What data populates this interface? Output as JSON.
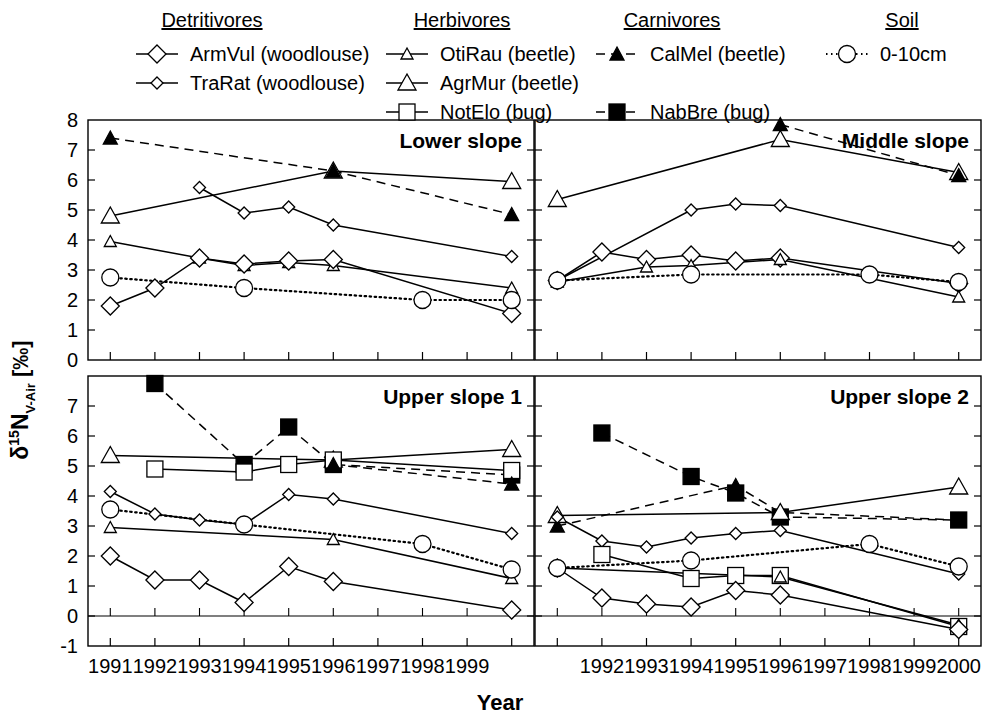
{
  "figure": {
    "xlabel": "Year",
    "ylabel_parts": {
      "delta": "δ",
      "mass": "15",
      "element": "N",
      "sub": "V-Air",
      "units": "[‰]"
    },
    "ylabel_plain": "δ15N V-Air [‰]"
  },
  "legend": {
    "groups": [
      {
        "title": "Detritivores",
        "entries": [
          {
            "label": "ArmVul (woodlouse)",
            "marker": "diamond-large",
            "line": "solid",
            "fill": "open"
          },
          {
            "label": "TraRat (woodlouse)",
            "marker": "diamond-small",
            "line": "solid",
            "fill": "open"
          }
        ]
      },
      {
        "title": "Herbivores",
        "entries": [
          {
            "label": "OtiRau (beetle)",
            "marker": "triangle-small",
            "line": "solid",
            "fill": "open"
          },
          {
            "label": "AgrMur (beetle)",
            "marker": "triangle-large",
            "line": "solid",
            "fill": "open"
          },
          {
            "label": "NotElo (bug)",
            "marker": "square-open",
            "line": "solid",
            "fill": "open"
          }
        ]
      },
      {
        "title": "Carnivores",
        "entries": [
          {
            "label": "CalMel (beetle)",
            "marker": "triangle-filled",
            "line": "dashed",
            "fill": "filled"
          },
          {
            "label": "NabBre (bug)",
            "marker": "square-filled",
            "line": "dashed",
            "fill": "filled"
          }
        ]
      },
      {
        "title": "Soil",
        "entries": [
          {
            "label": "0-10cm",
            "marker": "circle-open",
            "line": "dotted",
            "fill": "open"
          }
        ]
      }
    ]
  },
  "chart_data": {
    "type": "line",
    "title": "",
    "xlabel": "Year",
    "ylabel": "δ15N V-Air [‰]",
    "grid": false,
    "legend_position": "top",
    "panel_layout": {
      "rows": 2,
      "cols": 2
    },
    "series_styles": {
      "ArmVul": {
        "marker": "diamond-large",
        "line": "solid",
        "fill": "open"
      },
      "TraRat": {
        "marker": "diamond-small",
        "line": "solid",
        "fill": "open"
      },
      "OtiRau": {
        "marker": "triangle-small",
        "line": "solid",
        "fill": "open"
      },
      "AgrMur": {
        "marker": "triangle-large",
        "line": "solid",
        "fill": "open"
      },
      "NotElo": {
        "marker": "square-open",
        "line": "solid",
        "fill": "open"
      },
      "CalMel": {
        "marker": "triangle-filled",
        "line": "dashed",
        "fill": "filled"
      },
      "NabBre": {
        "marker": "square-filled",
        "line": "dashed",
        "fill": "filled"
      },
      "Soil": {
        "marker": "circle-open",
        "line": "dotted",
        "fill": "open"
      }
    },
    "panels": [
      {
        "name": "Lower slope",
        "position": "top-left",
        "xlim": [
          1990.5,
          2000.5
        ],
        "ylim": [
          0,
          8
        ],
        "yticks": [
          0,
          1,
          2,
          3,
          4,
          5,
          6,
          7,
          8
        ],
        "xticks": [
          1991,
          1992,
          1993,
          1994,
          1995,
          1996,
          1997,
          1998,
          1999,
          2000
        ],
        "xticklabels": [
          "1991",
          "1992",
          "1993",
          "1994",
          "1995",
          "1996",
          "1997",
          "1998",
          "1999",
          ""
        ],
        "series": [
          {
            "name": "AgrMur",
            "x": [
              1991,
              1996,
              2000
            ],
            "y": [
              4.8,
              6.3,
              5.95
            ]
          },
          {
            "name": "CalMel",
            "x": [
              1991,
              1996,
              2000
            ],
            "y": [
              7.4,
              6.3,
              4.85
            ]
          },
          {
            "name": "TraRat",
            "x": [
              1993,
              1994,
              1995,
              1996,
              2000
            ],
            "y": [
              5.75,
              4.9,
              5.1,
              4.5,
              3.45
            ]
          },
          {
            "name": "OtiRau",
            "x": [
              1991,
              1993,
              1994,
              1995,
              1996,
              2000
            ],
            "y": [
              3.95,
              3.4,
              3.15,
              3.25,
              3.15,
              2.4
            ]
          },
          {
            "name": "ArmVul",
            "x": [
              1991,
              1992,
              1993,
              1994,
              1995,
              1996,
              2000
            ],
            "y": [
              1.8,
              2.4,
              3.4,
              3.2,
              3.3,
              3.35,
              1.55
            ]
          },
          {
            "name": "Soil",
            "x": [
              1991,
              1994,
              1998,
              2000
            ],
            "y": [
              2.75,
              2.4,
              2.0,
              2.0
            ]
          }
        ]
      },
      {
        "name": "Middle slope",
        "position": "top-right",
        "xlim": [
          1990.5,
          2000.5
        ],
        "ylim": [
          0,
          8
        ],
        "yticks": [
          0,
          1,
          2,
          3,
          4,
          5,
          6,
          7,
          8
        ],
        "xticks": [
          1991,
          1992,
          1993,
          1994,
          1995,
          1996,
          1997,
          1998,
          1999,
          2000
        ],
        "xticklabels": [
          "",
          "1992",
          "1993",
          "1994",
          "1995",
          "1996",
          "1997",
          "1998",
          "1999",
          "2000"
        ],
        "series": [
          {
            "name": "AgrMur",
            "x": [
              1991,
              1996,
              2000
            ],
            "y": [
              5.35,
              7.35,
              6.25
            ]
          },
          {
            "name": "CalMel",
            "x": [
              1996,
              2000
            ],
            "y": [
              7.85,
              6.15
            ]
          },
          {
            "name": "TraRat",
            "x": [
              1991,
              1994,
              1995,
              1996,
              2000
            ],
            "y": [
              2.65,
              5.0,
              5.2,
              5.15,
              3.75
            ]
          },
          {
            "name": "ArmVul",
            "x": [
              1991,
              1992,
              1993,
              1994,
              1995,
              1996,
              2000
            ],
            "y": [
              2.65,
              3.6,
              3.35,
              3.5,
              3.3,
              3.4,
              2.55
            ]
          },
          {
            "name": "OtiRau",
            "x": [
              1991,
              1993,
              1994,
              1996,
              2000
            ],
            "y": [
              2.6,
              3.1,
              3.15,
              3.35,
              2.1
            ]
          },
          {
            "name": "Soil",
            "x": [
              1991,
              1994,
              1998,
              2000
            ],
            "y": [
              2.65,
              2.85,
              2.85,
              2.6
            ]
          }
        ]
      },
      {
        "name": "Upper slope 1",
        "position": "bottom-left",
        "xlim": [
          1990.5,
          2000.5
        ],
        "ylim": [
          -1,
          8
        ],
        "yticks": [
          -1,
          0,
          1,
          2,
          3,
          4,
          5,
          6,
          7
        ],
        "xticks": [
          1991,
          1992,
          1993,
          1994,
          1995,
          1996,
          1997,
          1998,
          1999,
          2000
        ],
        "xticklabels": [
          "1991",
          "1992",
          "1993",
          "1994",
          "1995",
          "1996",
          "1997",
          "1998",
          "1999",
          ""
        ],
        "series": [
          {
            "name": "NabBre",
            "x": [
              1992,
              1994,
              1995,
              1996,
              2000
            ],
            "y": [
              7.75,
              5.05,
              6.3,
              5.05,
              4.7
            ]
          },
          {
            "name": "AgrMur",
            "x": [
              1991,
              1996,
              2000
            ],
            "y": [
              5.35,
              5.2,
              5.55
            ]
          },
          {
            "name": "NotElo",
            "x": [
              1992,
              1994,
              1995,
              1996,
              2000
            ],
            "y": [
              4.9,
              4.8,
              5.05,
              5.2,
              4.85
            ]
          },
          {
            "name": "CalMel",
            "x": [
              1996,
              2000
            ],
            "y": [
              5.05,
              4.4
            ]
          },
          {
            "name": "TraRat",
            "x": [
              1991,
              1992,
              1993,
              1994,
              1995,
              1996,
              2000
            ],
            "y": [
              4.15,
              3.4,
              3.2,
              3.05,
              4.05,
              3.9,
              2.75
            ]
          },
          {
            "name": "OtiRau",
            "x": [
              1991,
              1996,
              2000
            ],
            "y": [
              2.95,
              2.55,
              1.25
            ]
          },
          {
            "name": "ArmVul",
            "x": [
              1991,
              1992,
              1993,
              1994,
              1995,
              1996,
              2000
            ],
            "y": [
              2.0,
              1.2,
              1.2,
              0.45,
              1.65,
              1.15,
              0.2
            ]
          },
          {
            "name": "Soil",
            "x": [
              1991,
              1994,
              1998,
              2000
            ],
            "y": [
              3.55,
              3.05,
              2.4,
              1.55
            ]
          }
        ]
      },
      {
        "name": "Upper slope 2",
        "position": "bottom-right",
        "xlim": [
          1990.5,
          2000.5
        ],
        "ylim": [
          -1,
          8
        ],
        "yticks": [
          -1,
          0,
          1,
          2,
          3,
          4,
          5,
          6,
          7
        ],
        "xticks": [
          1991,
          1992,
          1993,
          1994,
          1995,
          1996,
          1997,
          1998,
          1999,
          2000
        ],
        "xticklabels": [
          "",
          "1992",
          "1993",
          "1994",
          "1995",
          "1996",
          "1997",
          "1998",
          "1999",
          "2000"
        ],
        "series": [
          {
            "name": "NabBre",
            "x": [
              1992,
              1994,
              1995,
              1996,
              2000
            ],
            "y": [
              6.1,
              4.65,
              4.1,
              3.3,
              3.2
            ]
          },
          {
            "name": "CalMel",
            "x": [
              1991,
              1995,
              1996,
              2000
            ],
            "y": [
              3.0,
              4.35,
              3.45,
              3.2
            ]
          },
          {
            "name": "AgrMur",
            "x": [
              1991,
              1996,
              2000
            ],
            "y": [
              3.35,
              3.45,
              4.3
            ]
          },
          {
            "name": "TraRat",
            "x": [
              1991,
              1992,
              1993,
              1994,
              1995,
              1996,
              2000
            ],
            "y": [
              3.3,
              2.5,
              2.3,
              2.6,
              2.75,
              2.85,
              1.4
            ]
          },
          {
            "name": "NotElo",
            "x": [
              1992,
              1994,
              1995,
              1996,
              2000
            ],
            "y": [
              2.05,
              1.25,
              1.35,
              1.35,
              -0.35
            ]
          },
          {
            "name": "OtiRau",
            "x": [
              1991,
              1996,
              2000
            ],
            "y": [
              1.6,
              1.3,
              -0.3
            ]
          },
          {
            "name": "ArmVul",
            "x": [
              1991,
              1992,
              1993,
              1994,
              1995,
              1996,
              2000
            ],
            "y": [
              1.6,
              0.6,
              0.4,
              0.3,
              0.85,
              0.7,
              -0.45
            ]
          },
          {
            "name": "Soil",
            "x": [
              1991,
              1994,
              1998,
              2000
            ],
            "y": [
              1.6,
              1.85,
              2.4,
              1.65
            ]
          }
        ]
      }
    ]
  }
}
